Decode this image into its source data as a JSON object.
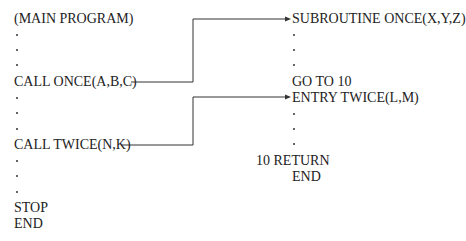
{
  "main_program": {
    "header": "(MAIN PROGRAM)",
    "call_once": "CALL ONCE(A,B,C)",
    "call_twice": "CALL TWICE(N,K)",
    "stop": "STOP",
    "end": "END"
  },
  "subroutine": {
    "header": "SUBROUTINE ONCE(X,Y,Z)",
    "goto": "GO TO 10",
    "entry": "ENTRY TWICE(L,M)",
    "return": "10 RETURN",
    "end": "END"
  },
  "connectors": [
    {
      "from": "CALL ONCE(A,B,C)",
      "to": "SUBROUTINE ONCE(X,Y,Z)"
    },
    {
      "from": "CALL TWICE(N,K)",
      "to": "ENTRY TWICE(L,M)"
    }
  ],
  "colors": {
    "text": "#222222",
    "line": "#333333"
  }
}
